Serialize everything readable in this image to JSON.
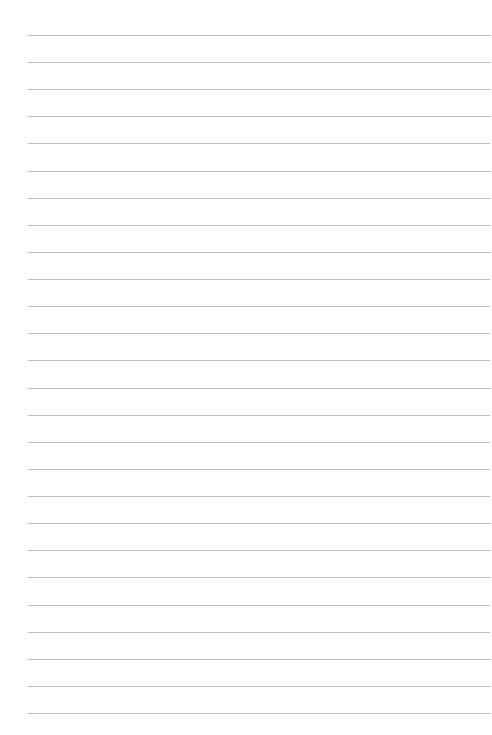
{
  "page": {
    "type": "lined-paper",
    "background_color": "#ffffff",
    "rule_color": "#bdbdbd",
    "rule_count": 26,
    "first_rule_y": 35,
    "rule_spacing": 27.12,
    "rule_left": 28,
    "rule_right": 490
  }
}
